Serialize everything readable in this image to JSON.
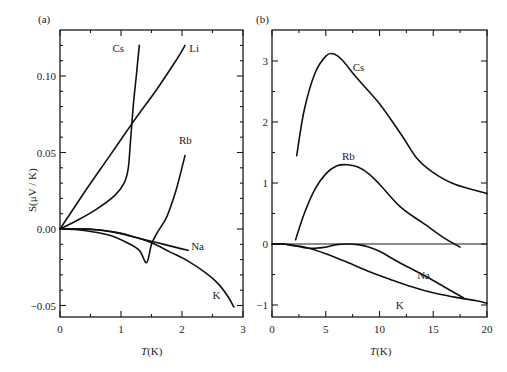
{
  "chart_data": [
    {
      "panel_label": "(a)",
      "type": "line",
      "title": "",
      "xlabel": "T(K)",
      "ylabel": "S(μV / K)",
      "xlim": [
        0,
        3
      ],
      "ylim": [
        -0.06,
        0.125
      ],
      "xticks": [
        0,
        1,
        2,
        3
      ],
      "xtick_labels": [
        "0",
        "1",
        "2",
        "3"
      ],
      "yticks": [
        -0.05,
        0.0,
        0.05,
        0.1
      ],
      "ytick_labels": [
        "-0.05",
        "0.00",
        "0.05",
        "0.10"
      ],
      "grid": false,
      "legend": "inline labels",
      "series": [
        {
          "name": "Cs",
          "x": [
            0,
            0.3,
            0.6,
            0.9,
            1.05,
            1.12,
            1.16,
            1.2,
            1.25,
            1.3
          ],
          "y": [
            0,
            0.006,
            0.013,
            0.022,
            0.03,
            0.04,
            0.06,
            0.08,
            0.1,
            0.12
          ]
        },
        {
          "name": "Li",
          "x": [
            0,
            0.4,
            0.8,
            1.2,
            1.6,
            1.9,
            2.05
          ],
          "y": [
            0,
            0.024,
            0.047,
            0.07,
            0.092,
            0.11,
            0.12
          ]
        },
        {
          "name": "Rb",
          "x": [
            0.05,
            0.4,
            0.8,
            1.1,
            1.3,
            1.42,
            1.5,
            1.6,
            1.75,
            1.9,
            2.05
          ],
          "y": [
            0,
            -0.001,
            -0.004,
            -0.009,
            -0.014,
            -0.022,
            -0.01,
            -0.002,
            0.008,
            0.025,
            0.048
          ]
        },
        {
          "name": "Na",
          "x": [
            0,
            0.3,
            0.7,
            1.0,
            1.3,
            1.6,
            1.9,
            2.1
          ],
          "y": [
            0,
            0,
            -0.001,
            -0.003,
            -0.006,
            -0.009,
            -0.012,
            -0.014
          ]
        },
        {
          "name": "K",
          "x": [
            0.15,
            0.5,
            0.9,
            1.2,
            1.5,
            1.8,
            2.1,
            2.4,
            2.6,
            2.75,
            2.85
          ],
          "y": [
            0,
            0,
            -0.002,
            -0.005,
            -0.009,
            -0.015,
            -0.021,
            -0.029,
            -0.036,
            -0.044,
            -0.051
          ]
        }
      ]
    },
    {
      "panel_label": "(b)",
      "type": "line",
      "title": "",
      "xlabel": "T(K)",
      "ylabel": "",
      "xlim": [
        0,
        20
      ],
      "ylim": [
        -1.25,
        3.45
      ],
      "xticks": [
        0,
        5,
        10,
        15,
        20
      ],
      "xtick_labels": [
        "0",
        "5",
        "10",
        "15",
        "20"
      ],
      "yticks": [
        -1,
        0,
        1,
        2,
        3
      ],
      "ytick_labels": [
        "-1",
        "0",
        "1",
        "2",
        "3"
      ],
      "grid": false,
      "zero_line": true,
      "legend": "inline labels",
      "series": [
        {
          "name": "Cs",
          "x": [
            2.3,
            3,
            4,
            5,
            5.7,
            6.5,
            8,
            10,
            12,
            13.5,
            15,
            17,
            20
          ],
          "y": [
            1.45,
            2.2,
            2.8,
            3.08,
            3.12,
            3.02,
            2.7,
            2.3,
            1.8,
            1.4,
            1.17,
            0.98,
            0.83
          ]
        },
        {
          "name": "Rb",
          "x": [
            2.2,
            3,
            4,
            5,
            6,
            7,
            8,
            9,
            10,
            12,
            14,
            16,
            17.5
          ],
          "y": [
            0.07,
            0.5,
            0.9,
            1.15,
            1.28,
            1.3,
            1.26,
            1.15,
            0.98,
            0.6,
            0.35,
            0.1,
            -0.05
          ]
        },
        {
          "name": "Na",
          "x": [
            0,
            1,
            2,
            3,
            4,
            5,
            6,
            7,
            8,
            9,
            10,
            12,
            14,
            16,
            17.8
          ],
          "y": [
            0,
            0,
            -0.02,
            -0.06,
            -0.07,
            -0.05,
            -0.01,
            0,
            -0.01,
            -0.05,
            -0.12,
            -0.32,
            -0.5,
            -0.7,
            -0.88
          ]
        },
        {
          "name": "K",
          "x": [
            0,
            1,
            2,
            3,
            5,
            7,
            9,
            11,
            13,
            15,
            17,
            19,
            20
          ],
          "y": [
            0,
            0,
            -0.03,
            -0.05,
            -0.16,
            -0.3,
            -0.45,
            -0.58,
            -0.7,
            -0.8,
            -0.87,
            -0.93,
            -0.97
          ]
        }
      ]
    }
  ],
  "panels": {
    "a": {
      "label": "(a)",
      "xlabel_main": "T",
      "xlabel_unit": "(K)",
      "ylabel": "S(μV / K)"
    },
    "b": {
      "label": "(b)",
      "xlabel_main": "T",
      "xlabel_unit": "(K)"
    }
  }
}
